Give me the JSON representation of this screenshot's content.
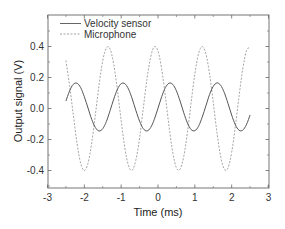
{
  "chart_data": {
    "type": "line",
    "title": "",
    "xlabel": "Time (ms)",
    "ylabel": "Output signal (V)",
    "xlim": [
      -3,
      3
    ],
    "ylim": [
      -0.5,
      0.6
    ],
    "xticks": [
      -3,
      -2,
      -1,
      0,
      1,
      2,
      3
    ],
    "xtick_labels": [
      "-3",
      "-2",
      "-1",
      "0",
      "1",
      "2",
      "3"
    ],
    "yticks": [
      -0.4,
      -0.2,
      0.0,
      0.2,
      0.4
    ],
    "ytick_labels": [
      "-0.4",
      "-0.2",
      "0.0",
      "0.2",
      "0.4"
    ],
    "grid": false,
    "legend_position": "upper left",
    "x": [
      -2.5,
      -2.4,
      -2.3,
      -2.2,
      -2.1,
      -2.0,
      -1.9,
      -1.8,
      -1.7,
      -1.6,
      -1.5,
      -1.4,
      -1.3,
      -1.2,
      -1.1,
      -1.0,
      -0.9,
      -0.8,
      -0.7,
      -0.6,
      -0.5,
      -0.4,
      -0.3,
      -0.2,
      -0.1,
      0.0,
      0.1,
      0.2,
      0.3,
      0.4,
      0.5,
      0.6,
      0.7,
      0.8,
      0.9,
      1.0,
      1.1,
      1.2,
      1.3,
      1.4,
      1.5,
      1.6,
      1.7,
      1.8,
      1.9,
      2.0,
      2.1,
      2.2,
      2.3,
      2.4,
      2.5
    ],
    "series": [
      {
        "name": "Velocity sensor",
        "style": "solid",
        "color": "#555555",
        "values": [
          0.048,
          0.114,
          0.156,
          0.163,
          0.135,
          0.076,
          0.003,
          -0.07,
          -0.123,
          -0.145,
          -0.13,
          -0.083,
          -0.013,
          0.062,
          0.125,
          0.16,
          0.16,
          0.125,
          0.062,
          -0.013,
          -0.082,
          -0.13,
          -0.145,
          -0.123,
          -0.07,
          0.002,
          0.076,
          0.135,
          0.163,
          0.156,
          0.114,
          0.048,
          -0.028,
          -0.094,
          -0.136,
          -0.143,
          -0.115,
          -0.056,
          0.017,
          0.09,
          0.143,
          0.165,
          0.15,
          0.103,
          0.033,
          -0.042,
          -0.105,
          -0.14,
          -0.14,
          -0.105,
          -0.042
        ]
      },
      {
        "name": "Microphone",
        "style": "dashed",
        "color": "#9a9a9a",
        "values": [
          0.309,
          0.148,
          -0.039,
          -0.222,
          -0.353,
          -0.4,
          -0.353,
          -0.222,
          -0.04,
          0.153,
          0.309,
          0.392,
          0.383,
          0.283,
          0.116,
          -0.078,
          -0.254,
          -0.37,
          -0.398,
          -0.332,
          -0.19,
          0.0,
          0.189,
          0.332,
          0.398,
          0.37,
          0.254,
          0.078,
          -0.116,
          -0.283,
          -0.383,
          -0.392,
          -0.309,
          -0.153,
          0.039,
          0.222,
          0.353,
          0.4,
          0.353,
          0.222,
          0.039,
          -0.153,
          -0.309,
          -0.392,
          -0.383,
          -0.283,
          -0.116,
          0.078,
          0.254,
          0.37,
          0.398
        ]
      }
    ]
  },
  "legend": {
    "items": [
      {
        "label": "Velocity sensor"
      },
      {
        "label": "Microphone"
      }
    ]
  }
}
